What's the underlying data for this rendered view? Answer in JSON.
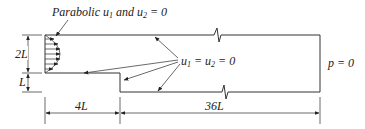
{
  "diagram": {
    "inlet_label": {
      "prefix": "Parabolic ",
      "u1": "u",
      "u1_sub": "1",
      "mid": " and ",
      "u2": "u",
      "u2_sub": "2",
      "suffix": " = 0"
    },
    "wall_label": {
      "u1": "u",
      "u1_sub": "1",
      "eq1": " = ",
      "u2": "u",
      "u2_sub": "2",
      "eq2": " = 0"
    },
    "outlet_label": "p = 0",
    "dimensions": {
      "inlet_height": "2L",
      "step_height": "L",
      "inlet_length": "4L",
      "downstream_length": "36L"
    },
    "colors": {
      "line": "#333333",
      "text": "#222222",
      "background": "#ffffff"
    }
  }
}
